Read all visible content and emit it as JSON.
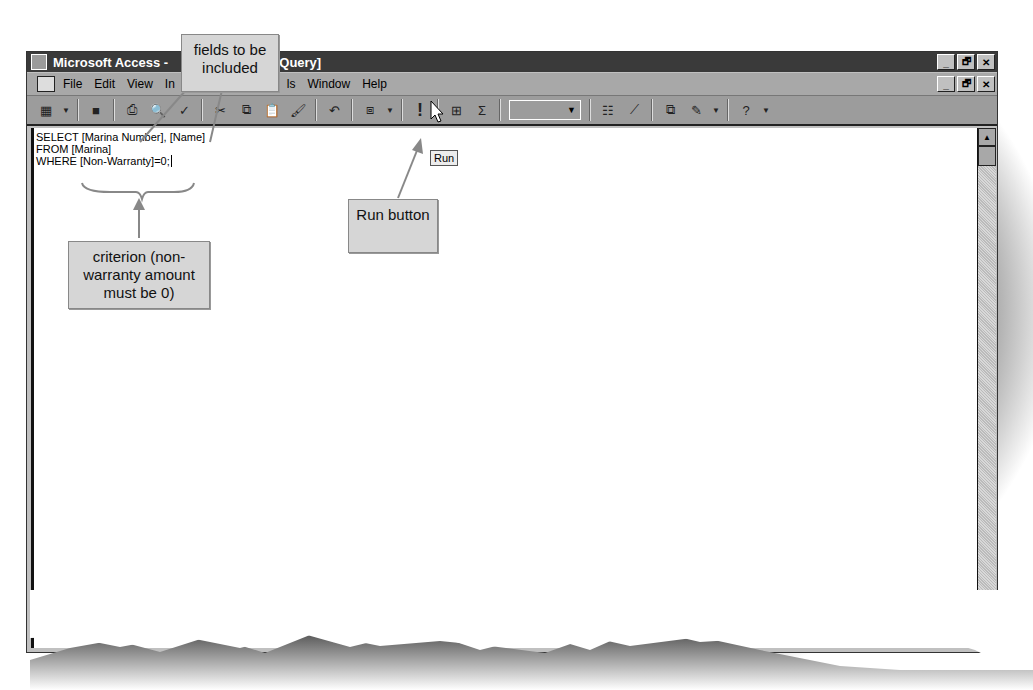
{
  "window": {
    "title": "Microsoft Access - [SQL Select Query]",
    "title_visible_left": "Microsoft Access -",
    "title_visible_right": "ct Query]",
    "controls": [
      "_",
      "🗗",
      "✕"
    ]
  },
  "menubar": {
    "items": [
      "File",
      "Edit",
      "View",
      "In",
      "ls",
      "Window",
      "Help"
    ]
  },
  "toolbar": {
    "run_tooltip": "Run",
    "run_glyph": "!",
    "combo_value": ""
  },
  "editor": {
    "sql_lines": [
      "SELECT [Marina Number], [Name]",
      "FROM [Marina]",
      "WHERE [Non-Warranty]=0;"
    ]
  },
  "callouts": {
    "fields": "fields to be included",
    "criterion": "criterion (non-warranty amount must be 0)",
    "run_button": "Run button"
  },
  "scrollbar": {
    "up_arrow": "▲"
  },
  "colors": {
    "titlebar": "#3a3a3a",
    "chrome": "#a8a8a8",
    "callout": "#d6d6d6"
  }
}
